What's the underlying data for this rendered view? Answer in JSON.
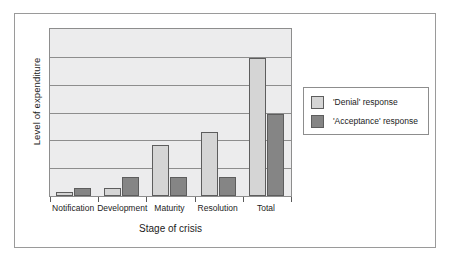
{
  "chart_data": {
    "type": "bar",
    "title": "",
    "xlabel": "Stage of crisis",
    "ylabel": "Level of expenditure",
    "categories": [
      "Notification",
      "Development",
      "Maturity",
      "Resolution",
      "Total"
    ],
    "series": [
      {
        "name": "'Denial' response",
        "color": "#d5d5d5",
        "values": [
          0.14,
          0.29,
          1.82,
          2.29,
          4.96
        ]
      },
      {
        "name": "'Acceptance' response",
        "color": "#858585",
        "values": [
          0.29,
          0.68,
          0.68,
          0.68,
          2.93
        ]
      }
    ],
    "ylim": [
      0,
      6
    ],
    "y_tick_labels": [],
    "gridlines": 6,
    "grid": true,
    "legend_position": "right",
    "plot_background": "#ececed",
    "axis_color": "#8d8d8d"
  },
  "axes": {
    "y_title": "Level of expenditure",
    "x_title": "Stage of crisis"
  },
  "x_labels": [
    "Notification",
    "Development",
    "Maturity",
    "Resolution",
    "Total"
  ],
  "legend": {
    "entries": [
      {
        "label": "'Denial' response"
      },
      {
        "label": "'Acceptance' response"
      }
    ]
  }
}
